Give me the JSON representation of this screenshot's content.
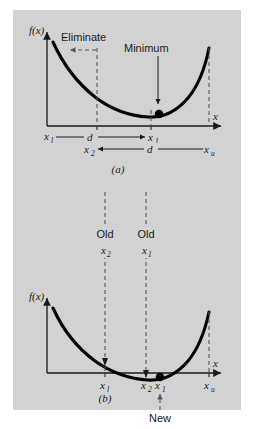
{
  "figure": {
    "background_color": "#d2d2d2",
    "page_color": "#ffffff",
    "curve_color": "#000000",
    "dashed_color": "#555555",
    "panels": [
      {
        "caption": "(a)",
        "y_axis_label": "f(x)",
        "x_axis_label": "x",
        "annotations": [
          {
            "name": "eliminate",
            "text": "Eliminate"
          },
          {
            "name": "minimum",
            "text": "Minimum"
          }
        ],
        "tick_labels": [
          {
            "base": "x",
            "sub": "l"
          },
          {
            "base": "x",
            "sub": "1"
          },
          {
            "base": "x",
            "sub": "u"
          }
        ],
        "distance_labels": [
          {
            "name": "d-upper",
            "text": "d"
          },
          {
            "name": "d-lower",
            "text": "d"
          }
        ],
        "interval_endpoints": [
          {
            "base": "x",
            "sub": "l"
          },
          {
            "base": "x",
            "sub": "1"
          },
          {
            "base": "x",
            "sub": "2"
          },
          {
            "base": "x",
            "sub": "u"
          }
        ]
      },
      {
        "caption": "(b)",
        "y_axis_label": "f(x)",
        "x_axis_label": "x",
        "annotations": [
          {
            "name": "old-x2",
            "line1": "Old",
            "base": "x",
            "sub": "2"
          },
          {
            "name": "old-x1",
            "line1": "Old",
            "base": "x",
            "sub": "1"
          },
          {
            "name": "new",
            "text": "New"
          }
        ],
        "tick_labels": [
          {
            "base": "x",
            "sub": "l"
          },
          {
            "base": "x",
            "sub": "2"
          },
          {
            "base": "x",
            "sub": "1"
          },
          {
            "base": "x",
            "sub": "u"
          }
        ]
      }
    ]
  },
  "chart_data": {
    "type": "line",
    "xlabel": "x",
    "ylabel": "f(x)",
    "grid": false,
    "legend": "none",
    "charts": [
      {
        "panel": "(a)",
        "xlim": [
          0,
          10
        ],
        "ylim": [
          0,
          10
        ],
        "series": [
          {
            "name": "f(x)",
            "x": [
              0.35,
              1.2,
              2.2,
              3.2,
              4.2,
              5.2,
              6.0,
              6.6,
              7.2,
              7.8,
              8.4,
              8.9,
              9.3
            ],
            "y": [
              8.6,
              7.0,
              5.5,
              4.3,
              3.4,
              2.75,
              2.45,
              2.35,
              2.45,
              2.95,
              3.9,
              5.5,
              7.9
            ]
          }
        ],
        "markers": [
          {
            "name": "minimum-point",
            "x": 6.7,
            "y": 2.35
          }
        ],
        "vlines": [
          {
            "name": "eliminate-boundary",
            "x": 2.85
          },
          {
            "name": "x1-line",
            "x": 6.25
          },
          {
            "name": "xu-line",
            "x": 9.3
          }
        ],
        "ticks": [
          {
            "label": "x_l",
            "x": 0.35
          },
          {
            "label": "x_1",
            "x": 6.25
          },
          {
            "label": "x_u",
            "x": 9.3
          }
        ]
      },
      {
        "panel": "(b)",
        "xlim": [
          0,
          10
        ],
        "ylim": [
          0,
          10
        ],
        "series": [
          {
            "name": "f(x)",
            "x": [
              0.35,
              1.2,
              2.2,
              3.2,
              4.2,
              5.2,
              6.0,
              6.6,
              7.2,
              7.8,
              8.4,
              8.9,
              9.3
            ],
            "y": [
              8.6,
              7.0,
              5.5,
              4.3,
              3.4,
              2.75,
              2.45,
              2.35,
              2.45,
              2.95,
              3.9,
              5.5,
              7.9
            ]
          }
        ],
        "markers": [
          {
            "name": "minimum-point",
            "x": 6.7,
            "y": 2.35
          }
        ],
        "vlines": [
          {
            "name": "old-x2-line",
            "x": 3.35
          },
          {
            "name": "old-x1-line",
            "x": 6.0
          },
          {
            "name": "new-x1-line",
            "x": 6.7
          },
          {
            "name": "xu-line",
            "x": 9.3
          }
        ],
        "ticks": [
          {
            "label": "x_l",
            "x": 3.35
          },
          {
            "label": "x_2",
            "x": 6.0
          },
          {
            "label": "x_1",
            "x": 6.7
          },
          {
            "label": "x_u",
            "x": 9.3
          }
        ]
      }
    ]
  }
}
